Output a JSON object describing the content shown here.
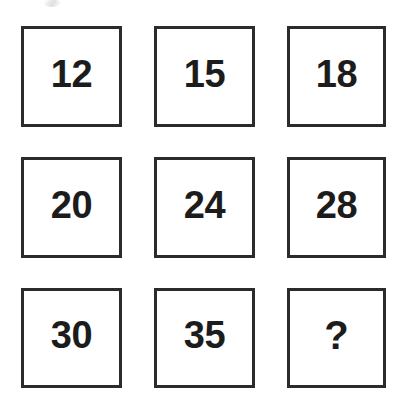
{
  "page": {
    "background_color": "#ffffff",
    "border_color": "#2b2b2b",
    "text_color": "#1c1c1c"
  },
  "grid": {
    "rows": 3,
    "columns": 3,
    "cells": [
      {
        "value": "12",
        "row": 1,
        "column": 1,
        "is_unknown": false
      },
      {
        "value": "15",
        "row": 1,
        "column": 2,
        "is_unknown": false
      },
      {
        "value": "18",
        "row": 1,
        "column": 3,
        "is_unknown": false
      },
      {
        "value": "20",
        "row": 2,
        "column": 1,
        "is_unknown": false
      },
      {
        "value": "24",
        "row": 2,
        "column": 2,
        "is_unknown": false
      },
      {
        "value": "28",
        "row": 2,
        "column": 3,
        "is_unknown": false
      },
      {
        "value": "30",
        "row": 3,
        "column": 1,
        "is_unknown": false
      },
      {
        "value": "35",
        "row": 3,
        "column": 2,
        "is_unknown": false
      },
      {
        "value": "?",
        "row": 3,
        "column": 3,
        "is_unknown": true
      }
    ]
  }
}
